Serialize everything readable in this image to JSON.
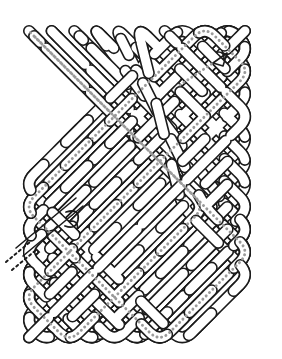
{
  "figure": {
    "kind": "celtic-knot",
    "canvas": {
      "width": 282,
      "height": 359,
      "background": "#ffffff"
    },
    "colors": {
      "outline": "#1b1b1b",
      "band_fill": "#ffffff",
      "trace_dot": "#9a9a9a",
      "shadow": "#6f6f6f"
    },
    "geometry": {
      "grid_origin_x": 24,
      "grid_origin_y": 26,
      "cell": 22.6,
      "cols": 10,
      "rows": 14,
      "band_width": 9,
      "outline_width": 1.6,
      "corner_radius": 26
    },
    "annotations": {
      "arrowhead_label": "direction-arrow",
      "arrowhead_x": 222,
      "arrowhead_y": 57,
      "tail_label": "strand-tail",
      "tail_x": 14,
      "tail_y": 232,
      "trace_label": "traced-strand",
      "trace_dot_radius": 1.45,
      "trace_dot_gap": 4.6
    }
  }
}
